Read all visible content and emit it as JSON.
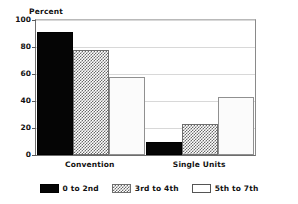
{
  "chart_data": {
    "type": "bar",
    "title": "",
    "xlabel": "",
    "ylabel": "Percent",
    "ylim": [
      0,
      100
    ],
    "yticks": [
      0,
      20,
      40,
      60,
      80,
      100
    ],
    "ytick_labels": [
      "0",
      "20",
      "40",
      "60",
      "80",
      "100"
    ],
    "grid": true,
    "legend_position": "bottom-center",
    "categories": [
      "Convention",
      "Single Units"
    ],
    "series": [
      {
        "name": "0 to 2nd",
        "values": [
          91,
          10
        ],
        "fill": "solid-black",
        "color": "#050505"
      },
      {
        "name": "3rd to 4th",
        "values": [
          78,
          23
        ],
        "fill": "checker-gray",
        "color": "#6a6a6a"
      },
      {
        "name": "5th to 7th",
        "values": [
          58,
          43
        ],
        "fill": "sparse-dot-light",
        "color": "#c9c9c9"
      }
    ]
  },
  "legend": {
    "items": [
      {
        "label": "0 to 2nd"
      },
      {
        "label": "3rd to 4th"
      },
      {
        "label": "5th to 7th"
      }
    ]
  }
}
